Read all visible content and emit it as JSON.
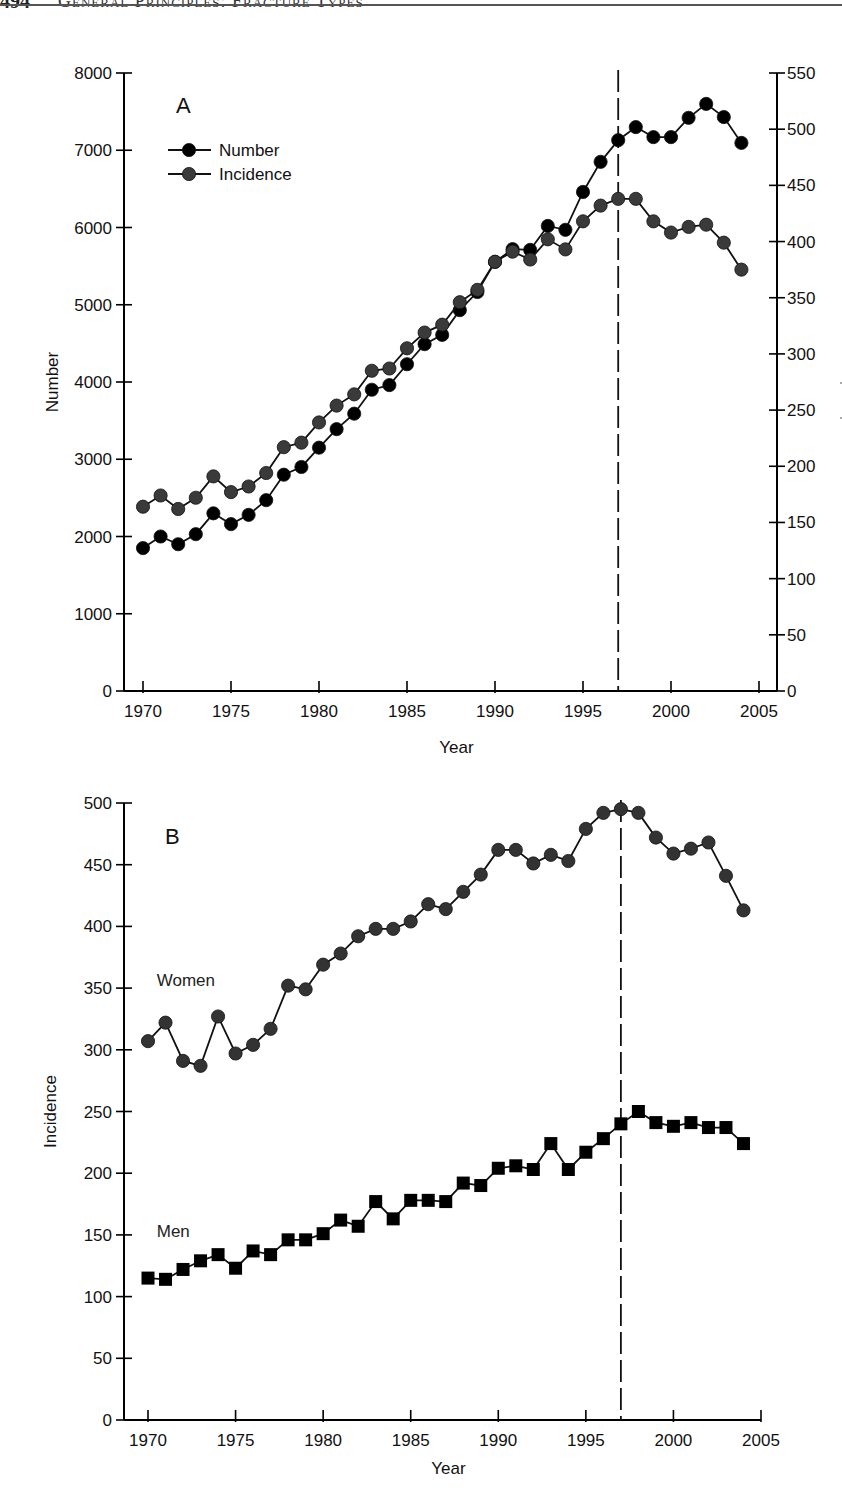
{
  "page_header": {
    "page_number": "494",
    "running_title": "General Principles: Fracture Types"
  },
  "colors": {
    "number_series": "#000000",
    "incidence_series": "#3a3a3a",
    "women_series": "#333333",
    "men_series": "#000000",
    "axis": "#000000"
  },
  "chart_data": [
    {
      "id": "A",
      "type": "line",
      "panel_label": "A",
      "title": "",
      "xlabel": "Year",
      "ylabel": "Number",
      "y2label": "",
      "xlim": [
        1968.6,
        2006.2
      ],
      "ylim": [
        0,
        8000
      ],
      "y2lim": [
        0,
        550
      ],
      "xticks": [
        1970,
        1975,
        1980,
        1985,
        1990,
        1995,
        2000,
        2005
      ],
      "yticks": [
        0,
        1000,
        2000,
        3000,
        4000,
        5000,
        6000,
        7000,
        8000
      ],
      "y2ticks": [
        0,
        50,
        100,
        150,
        200,
        250,
        300,
        350,
        400,
        450,
        500,
        550
      ],
      "grid": false,
      "legend": {
        "position": "upper-left",
        "entries": [
          "Number",
          "Incidence"
        ]
      },
      "annotations": [
        {
          "type": "vertical-dashed-line",
          "x": 1997
        }
      ],
      "x": [
        1970,
        1971,
        1972,
        1973,
        1974,
        1975,
        1976,
        1977,
        1978,
        1979,
        1980,
        1981,
        1982,
        1983,
        1984,
        1985,
        1986,
        1987,
        1988,
        1989,
        1990,
        1991,
        1992,
        1993,
        1994,
        1995,
        1996,
        1997,
        1998,
        1999,
        2000,
        2001,
        2002,
        2003,
        2004
      ],
      "series": [
        {
          "name": "Number",
          "axis": "left",
          "marker": "circle",
          "values": [
            1850,
            2000,
            1900,
            2030,
            2300,
            2160,
            2280,
            2470,
            2800,
            2900,
            3150,
            3390,
            3590,
            3900,
            3960,
            4230,
            4490,
            4610,
            4930,
            5165,
            5555,
            5720,
            5710,
            6020,
            5970,
            6460,
            6850,
            7130,
            7300,
            7170,
            7170,
            7420,
            7600,
            7430,
            7095
          ]
        },
        {
          "name": "Incidence",
          "axis": "right",
          "marker": "circle",
          "values": [
            164,
            174,
            162,
            172,
            191,
            177,
            182,
            194,
            217,
            221,
            239,
            254,
            264,
            285,
            287,
            305,
            319,
            326,
            346,
            357,
            382,
            391,
            384,
            402,
            393,
            418,
            432,
            438,
            438,
            418,
            408,
            413,
            415,
            399,
            375
          ]
        }
      ]
    },
    {
      "id": "B",
      "type": "line",
      "panel_label": "B",
      "title": "",
      "xlabel": "Year",
      "ylabel": "Incidence",
      "xlim": [
        1968.6,
        2005
      ],
      "ylim": [
        0,
        500
      ],
      "xticks": [
        1970,
        1975,
        1980,
        1985,
        1990,
        1995,
        2000,
        2005
      ],
      "yticks": [
        0,
        50,
        100,
        150,
        200,
        250,
        300,
        350,
        400,
        450,
        500
      ],
      "grid": false,
      "legend": {
        "position": "inline-labels",
        "entries": [
          "Women",
          "Men"
        ]
      },
      "annotations": [
        {
          "type": "vertical-dashed-line",
          "x": 1997
        }
      ],
      "x": [
        1970,
        1971,
        1972,
        1973,
        1974,
        1975,
        1976,
        1977,
        1978,
        1979,
        1980,
        1981,
        1982,
        1983,
        1984,
        1985,
        1986,
        1987,
        1988,
        1989,
        1990,
        1991,
        1992,
        1993,
        1994,
        1995,
        1996,
        1997,
        1998,
        1999,
        2000,
        2001,
        2002,
        2003,
        2004
      ],
      "series": [
        {
          "name": "Women",
          "marker": "circle",
          "label_position": {
            "x": 1970.5,
            "y": 352
          },
          "values": [
            307,
            322,
            291,
            287,
            327,
            297,
            304,
            317,
            352,
            349,
            369,
            378,
            392,
            398,
            398,
            404,
            418,
            414,
            428,
            442,
            462,
            462,
            451,
            458,
            453,
            479,
            492,
            495,
            492,
            472,
            459,
            463,
            468,
            441,
            413
          ]
        },
        {
          "name": "Men",
          "marker": "square",
          "label_position": {
            "x": 1970.5,
            "y": 148
          },
          "values": [
            115,
            114,
            122,
            129,
            134,
            123,
            137,
            134,
            146,
            146,
            151,
            162,
            157,
            177,
            163,
            178,
            178,
            177,
            192,
            190,
            204,
            206,
            203,
            224,
            203,
            217,
            228,
            240,
            250,
            241,
            238,
            241,
            237,
            237,
            224
          ]
        }
      ]
    }
  ]
}
